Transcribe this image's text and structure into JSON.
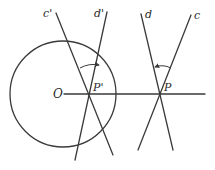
{
  "diagram": {
    "type": "geometric-inversion-figure",
    "colors": {
      "stroke": "#3a3a3a",
      "text": "#2a2a2a",
      "background": "#ffffff"
    },
    "circle": {
      "center_label": "O",
      "cx": 63,
      "cy": 94,
      "r": 53
    },
    "axis_line": {
      "x1": 64,
      "y1": 94,
      "x2": 205,
      "y2": 94
    },
    "points": {
      "P_prime": {
        "label": "P'",
        "x": 90,
        "y": 94
      },
      "P": {
        "label": "P",
        "x": 160,
        "y": 94
      }
    },
    "lines": [
      {
        "label": "c'",
        "x1": 56,
        "y1": 13,
        "x2": 113,
        "y2": 155
      },
      {
        "label": "d'",
        "x1": 107,
        "y1": 12,
        "x2": 75,
        "y2": 160
      },
      {
        "label": "d",
        "x1": 141,
        "y1": 14,
        "x2": 173,
        "y2": 150
      },
      {
        "label": "c",
        "x1": 191,
        "y1": 15,
        "x2": 138,
        "y2": 150
      }
    ],
    "labels": {
      "c_prime": "c'",
      "d_prime": "d'",
      "d": "d",
      "c": "c",
      "O": "O",
      "P_prime": "P'",
      "P": "P"
    },
    "angle_arcs": [
      {
        "at": "P'",
        "from": "c'",
        "to": "d'",
        "arrow_direction": "toward d'"
      },
      {
        "at": "P",
        "from": "c",
        "to": "d",
        "arrow_direction": "toward d"
      }
    ]
  }
}
